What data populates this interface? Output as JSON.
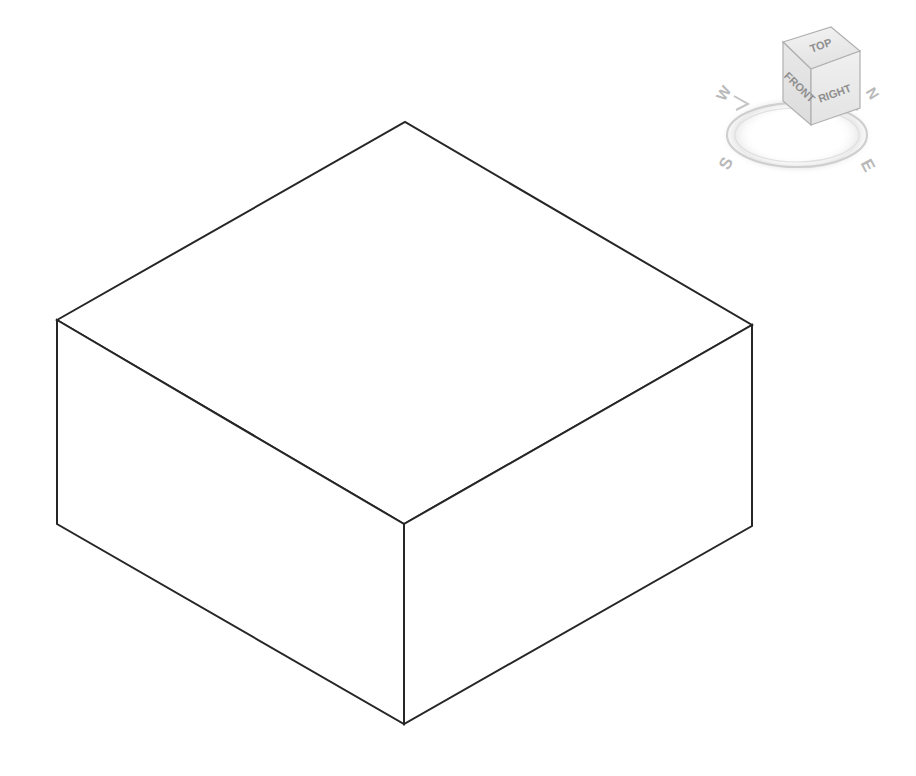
{
  "app": {
    "background_color": "#ffffff",
    "viewport_name": "3d-model-viewport"
  },
  "model": {
    "name": "isometric-rectangular-block",
    "description": "Isometric rectangular slab / block solid wireframe",
    "edge_color": "#262626",
    "edge_width": 2,
    "fill_color": "#ffffff",
    "vertices": {
      "top_left": [
        57,
        320
      ],
      "top_back": [
        405,
        122
      ],
      "top_right": [
        752,
        325
      ],
      "top_front": [
        404,
        524
      ],
      "bottom_left": [
        57,
        524
      ],
      "bottom_front": [
        404,
        724
      ],
      "bottom_right": [
        752,
        526
      ]
    },
    "faces": [
      {
        "name": "top-face",
        "points": "57,320 405,122 752,325 404,524"
      },
      {
        "name": "front-left-face",
        "points": "57,320 404,524 404,724 57,524"
      },
      {
        "name": "front-right-face",
        "points": "404,524 752,325 752,526 404,724"
      }
    ]
  },
  "viewcube": {
    "name": "view-cube-navigation-widget",
    "faces": {
      "top": "TOP",
      "front": "FRONT",
      "right": "RIGHT"
    },
    "face_colors": {
      "top": "#eeeeee",
      "front": "#e4e4e4",
      "right": "#ececec"
    },
    "edge_color": "#b0b0b0",
    "label_color": "#8f8f8f",
    "compass": {
      "name": "compass-ring",
      "ring_color": "#cfcfcf",
      "label_color": "#b9b9b9",
      "labels": {
        "north": "N",
        "south": "S",
        "east": "E",
        "west": "W"
      }
    }
  }
}
